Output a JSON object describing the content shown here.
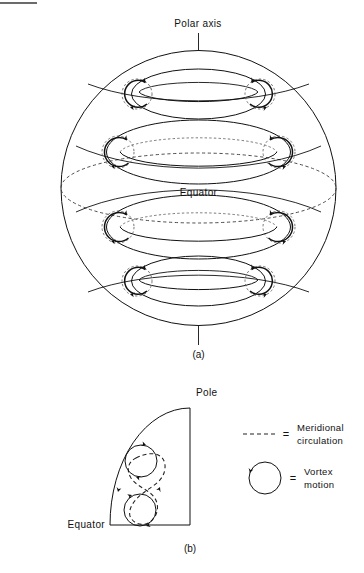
{
  "figure": {
    "title_caption": "",
    "panels": [
      {
        "id": "a",
        "tag": "(a)",
        "labels": {
          "polar_axis": "Polar axis",
          "equator": "Equator"
        },
        "description": "Sphere with four toroidal vortex rings arranged symmetrically about the equator",
        "ring_count": 4
      },
      {
        "id": "b",
        "tag": "(b)",
        "labels": {
          "pole": "Pole",
          "equator": "Equator"
        },
        "description": "Meridional quadrant cross-section showing two vortex cells linked by meridional circulation",
        "vortex_count": 2
      }
    ]
  },
  "legend": {
    "items": [
      {
        "symbol": "dashed-line",
        "equals": "=",
        "label_line1": "Meridional",
        "label_line2": "circulation"
      },
      {
        "symbol": "circle-arrow",
        "equals": "=",
        "label_line1": "Vortex",
        "label_line2": "motion"
      }
    ]
  },
  "colors": {
    "ink": "#111111",
    "dashed_ink": "#3a3a3a",
    "rule": "#6b6b6b",
    "background": "#ffffff"
  }
}
